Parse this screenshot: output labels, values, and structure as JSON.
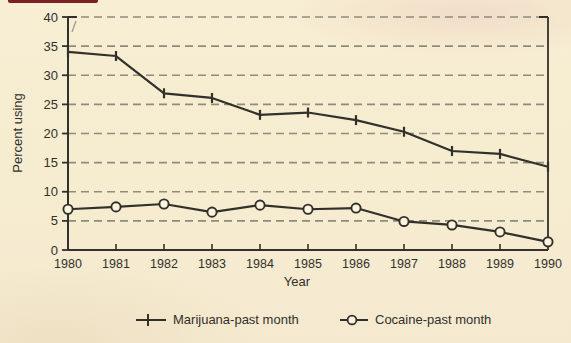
{
  "figure": {
    "type": "scanned-textbook-line-chart",
    "background_color": "#f6ecd0",
    "line_color": "#32302a",
    "grid_color": "#8f8c7d",
    "text_color": "#33302a",
    "artifact_color": "#7b2026",
    "marker_fill": "#faf3de"
  },
  "chart_data": {
    "type": "line",
    "title": "",
    "xlabel": "Year",
    "ylabel": "Percent using",
    "x": [
      1980,
      1981,
      1982,
      1983,
      1984,
      1985,
      1986,
      1987,
      1988,
      1989,
      1990
    ],
    "series": [
      {
        "name": "Marijuana-past month",
        "marker": "plus",
        "values": [
          34.0,
          33.3,
          26.9,
          26.1,
          23.2,
          23.6,
          22.3,
          20.3,
          17.0,
          16.5,
          14.3
        ]
      },
      {
        "name": "Cocaine-past month",
        "marker": "circle",
        "values": [
          7.0,
          7.4,
          7.9,
          6.5,
          7.7,
          7.0,
          7.2,
          4.9,
          4.3,
          3.1,
          1.4
        ]
      }
    ],
    "ylim": [
      0,
      40
    ],
    "ytick_step": 5,
    "grid": "horizontal-dashed",
    "legend_position": "bottom"
  },
  "legend": {
    "marijuana_label": "Marijuana-past month",
    "cocaine_label": "Cocaine-past month"
  },
  "axes": {
    "ylabel": "Percent using",
    "xlabel": "Year"
  }
}
